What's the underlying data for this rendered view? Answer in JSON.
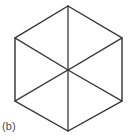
{
  "figure": {
    "caption": "(b)",
    "shape_name": "hexagon",
    "orientation": "pointy-top",
    "subdivision": "six-triangles-from-center",
    "stroke_color": "#333333",
    "spoke_color": "#3a3a3a",
    "background_color": "#ffffff",
    "caption_color": "#4a4a4a",
    "canvas": {
      "width": 130,
      "height": 140
    },
    "center": {
      "x": 68,
      "y": 70
    },
    "vertices": [
      {
        "name": "top",
        "x": 68,
        "y": 6
      },
      {
        "name": "top-right",
        "x": 122,
        "y": 38
      },
      {
        "name": "bottom-right",
        "x": 122,
        "y": 101
      },
      {
        "name": "bottom",
        "x": 68,
        "y": 131
      },
      {
        "name": "bottom-left",
        "x": 15,
        "y": 101
      },
      {
        "name": "top-left",
        "x": 15,
        "y": 38
      }
    ],
    "outline_points": "68,6 122,38 122,101 68,131 15,101 15,38",
    "spokes": [
      {
        "name": "spoke-to-top",
        "x1": 68,
        "y1": 70,
        "x2": 68,
        "y2": 6
      },
      {
        "name": "spoke-to-top-right",
        "x1": 68,
        "y1": 70,
        "x2": 122,
        "y2": 38
      },
      {
        "name": "spoke-to-bottom-right",
        "x1": 68,
        "y1": 70,
        "x2": 122,
        "y2": 101
      },
      {
        "name": "spoke-to-bottom",
        "x1": 68,
        "y1": 70,
        "x2": 68,
        "y2": 131
      },
      {
        "name": "spoke-to-bottom-left",
        "x1": 68,
        "y1": 70,
        "x2": 15,
        "y2": 101
      },
      {
        "name": "spoke-to-top-left",
        "x1": 68,
        "y1": 70,
        "x2": 15,
        "y2": 38
      }
    ]
  }
}
